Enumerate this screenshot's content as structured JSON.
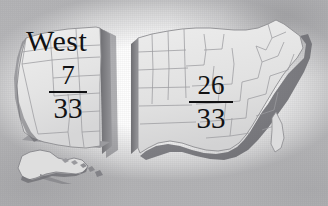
{
  "figure": {
    "kind": "us-map-diagram",
    "background_color": "#fdfdfd",
    "vignette_color": "#969699",
    "text_color": "#121214"
  },
  "regions": {
    "west": {
      "title": "West",
      "fraction": {
        "numerator": "7",
        "denominator": "33"
      },
      "fill_color": "#e6e6e6",
      "edge_color": "#8f8f92",
      "shadow_color": "#7f7f83"
    },
    "east": {
      "title": "",
      "fraction": {
        "numerator": "26",
        "denominator": "33"
      },
      "fill_color": "#e3e3e3",
      "edge_color": "#8f8f92",
      "shadow_color": "#7f7f83"
    }
  },
  "insets": {
    "alaska": {
      "label": "",
      "fill_color": "#dedede"
    },
    "hawaii": {
      "label": "",
      "fill_color": "#d8d8d8"
    }
  },
  "coastline": {
    "shade_color": "#6f6f74",
    "border_color": "#58585c"
  }
}
